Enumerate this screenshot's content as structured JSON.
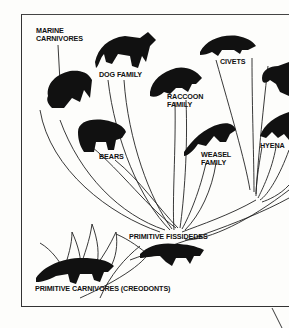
{
  "diagram": {
    "type": "evolutionary tree",
    "root": "PRIMITIVE CARNIVORES (CREODONTS)",
    "intermediate": "PRIMITIVE FISSIDEDES",
    "labels": {
      "marine_line1": "MARINE",
      "marine_line2": "CARNIVORES",
      "dog": "DOG FAMILY",
      "civets": "CIVETS",
      "raccoon_line1": "RACCOON",
      "raccoon_line2": "FAMILY",
      "bears": "BEARS",
      "weasel_line1": "WEASEL",
      "weasel_line2": "FAMILY",
      "hyena": "HYENA",
      "fissidedes": "PRIMITIVE FISSIDEDES",
      "creodonts": "PRIMITIVE CARNIVORES (CREODONTS)"
    },
    "animals": [
      "walrus",
      "fox",
      "civet",
      "raccoon",
      "bear",
      "weasel",
      "cat",
      "hyena",
      "fissiped",
      "creodont"
    ],
    "colors": {
      "ink": "#111111",
      "paper": "#fdfdfb"
    }
  }
}
